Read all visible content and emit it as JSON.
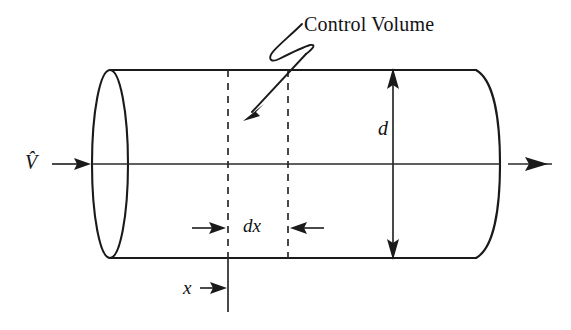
{
  "figure": {
    "type": "engineering-diagram",
    "background_color": "#ffffff",
    "line_color": "#1a1a1a"
  },
  "labels": {
    "control_volume": "Control Volume",
    "inlet_velocity": "V̂",
    "diameter": "d",
    "element_length": "dx",
    "axial_position": "x"
  },
  "icons": {
    "inlet_flow_arrow": "arrow-right-icon",
    "outlet_flow_arrow": "arrow-right-icon",
    "diameter_dimension_arrow": "double-arrow-vertical-icon",
    "dx_dimension_arrow": "double-arrow-horizontal-inward-icon",
    "x_dimension_arrow": "arrow-right-icon",
    "leader_arrow": "squiggle-leader-arrow-icon"
  },
  "geometry": {
    "cylinder": {
      "top_edge_y": 70,
      "bottom_edge_y": 258,
      "left_end_x": 110,
      "right_end_x": 476,
      "left_cap_rx": 18,
      "right_cap_bulge": 22,
      "centerline_y": 164
    },
    "control_volume": {
      "left_dashed_x": 228,
      "right_dashed_x": 288
    },
    "dimensions": {
      "diameter_line_x": 393,
      "dx_label_y": 228,
      "x_tick_bottom_y": 312
    }
  }
}
